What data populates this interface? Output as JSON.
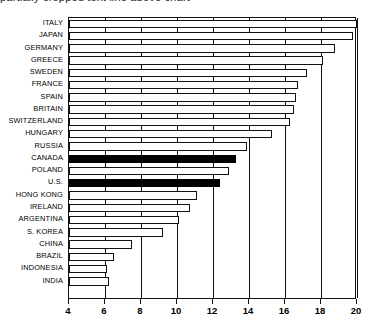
{
  "clipped_caption": "partially cropped text line above chart",
  "chart_data": {
    "type": "bar",
    "orientation": "horizontal",
    "title": "",
    "subtitle": "",
    "xlabel": "",
    "ylabel": "",
    "xlim": [
      4,
      20
    ],
    "xticks": [
      4,
      6,
      8,
      10,
      12,
      14,
      16,
      18,
      20
    ],
    "xticklabels": [
      "4",
      "6",
      "8",
      "10",
      "12",
      "14",
      "16",
      "18",
      "20"
    ],
    "grid": true,
    "legend": "none",
    "categories": [
      "ITALY",
      "JAPAN",
      "GERMANY",
      "GREECE",
      "SWEDEN",
      "FRANCE",
      "SPAIN",
      "BRITAIN",
      "SWITZERLAND",
      "HUNGARY",
      "RUSSIA",
      "CANADA",
      "POLAND",
      "U.S.",
      "HONG KONG",
      "IRELAND",
      "ARGENTINA",
      "S. KOREA",
      "CHINA",
      "BRAZIL",
      "INDONESIA",
      "INDIA"
    ],
    "values": [
      20.0,
      19.8,
      18.8,
      18.1,
      17.2,
      16.7,
      16.6,
      16.5,
      16.3,
      15.3,
      13.9,
      13.3,
      12.9,
      12.4,
      11.1,
      10.7,
      10.1,
      9.2,
      7.5,
      6.5,
      6.1,
      6.2
    ],
    "highlighted": [
      "CANADA",
      "U.S."
    ],
    "colors": {
      "bar_fill": "#ffffff",
      "bar_stroke": "#111111",
      "highlight_fill": "#000000",
      "axis": "#111111",
      "background": "#ffffff"
    }
  }
}
